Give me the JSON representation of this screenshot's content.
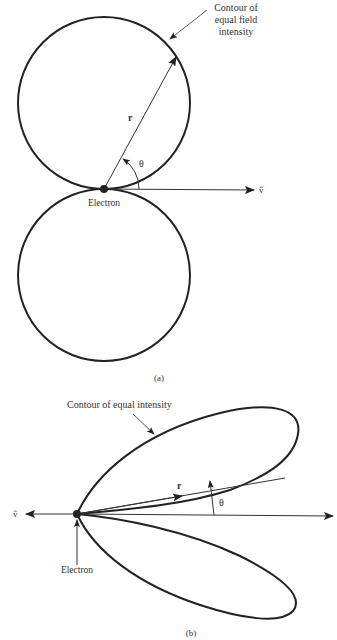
{
  "panel_a": {
    "caption": "(a)",
    "contour_label_lines": [
      "Contour of",
      "equal field",
      "intensity"
    ],
    "r_label": "r",
    "theta_label": "θ",
    "v_label": "v̂",
    "electron_label": "Electron"
  },
  "panel_b": {
    "caption": "(b)",
    "contour_label": "Contour of equal intensity",
    "r_label": "r",
    "theta_label": "θ",
    "v_label": "v̂",
    "electron_label": "Electron"
  },
  "colors": {
    "stroke": "#222222",
    "text": "#333333",
    "background": "#ffffff"
  }
}
